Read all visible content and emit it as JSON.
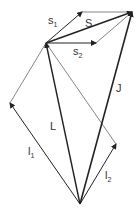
{
  "diagram": {
    "type": "vector-diagram",
    "points": {
      "hub": [
        46,
        43
      ],
      "top_right": [
        132,
        12
      ],
      "s1_end": [
        82,
        12
      ],
      "s2_end": [
        96,
        43
      ],
      "i1_end": [
        10,
        103
      ],
      "i2_end": [
        116,
        144
      ],
      "bottom": [
        80,
        204
      ]
    },
    "vectors": [
      {
        "id": "s1",
        "label": "s",
        "subscript": "1"
      },
      {
        "id": "s2",
        "label": "s",
        "subscript": "2"
      },
      {
        "id": "S",
        "label": "S",
        "subscript": ""
      },
      {
        "id": "J",
        "label": "J",
        "subscript": ""
      },
      {
        "id": "L",
        "label": "L",
        "subscript": ""
      },
      {
        "id": "l1",
        "label": "l",
        "subscript": "1"
      },
      {
        "id": "l2",
        "label": "l",
        "subscript": "2"
      }
    ],
    "colors": {
      "heavy": "#222222",
      "thin": "#555555",
      "text": "#333333"
    }
  }
}
